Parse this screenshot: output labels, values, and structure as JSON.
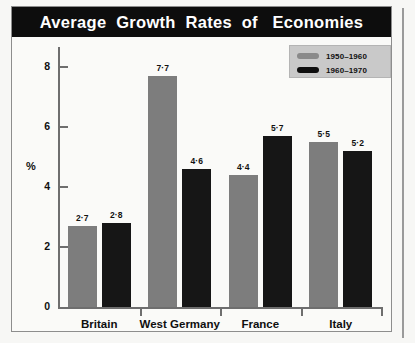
{
  "figure": {
    "title": "Average  Growth  Rates  of   Economies"
  },
  "legend": {
    "items": [
      {
        "label": "1950–1960",
        "swatch": "light-gray-swatch-icon",
        "color": "#8a8a8a"
      },
      {
        "label": "1960–1970",
        "swatch": "dark-swatch-icon",
        "color": "#0e0e0e"
      }
    ]
  },
  "axes": {
    "y_title": "%",
    "y_ticks": [
      "0",
      "2",
      "4",
      "6",
      "8"
    ]
  },
  "chart_data": {
    "type": "bar",
    "title": "Average Growth Rates of Economies",
    "xlabel": "",
    "ylabel": "%",
    "ylim": [
      0,
      8.6
    ],
    "yticks": [
      0,
      2,
      4,
      6,
      8
    ],
    "grid": false,
    "legend_position": "top-right",
    "categories": [
      "Britain",
      "West Germany",
      "France",
      "Italy"
    ],
    "series": [
      {
        "name": "1950–1960",
        "color": "#7d7d7d",
        "values": [
          2.7,
          7.7,
          4.4,
          5.5
        ],
        "labels": [
          "2·7",
          "7·7",
          "4·4",
          "5·5"
        ]
      },
      {
        "name": "1960–1970",
        "color": "#161616",
        "values": [
          2.8,
          4.6,
          5.7,
          5.2
        ],
        "labels": [
          "2·8",
          "4·6",
          "5·7",
          "5·2"
        ]
      }
    ]
  },
  "colors": {
    "title_bar": "#0d0d0d",
    "title_text": "#ffffff",
    "series_1950": "#7d7d7d",
    "series_1960": "#161616",
    "axis": "#6e6e6e",
    "legend_bg": "#c9c9c9",
    "paper": "#fafaf8"
  }
}
